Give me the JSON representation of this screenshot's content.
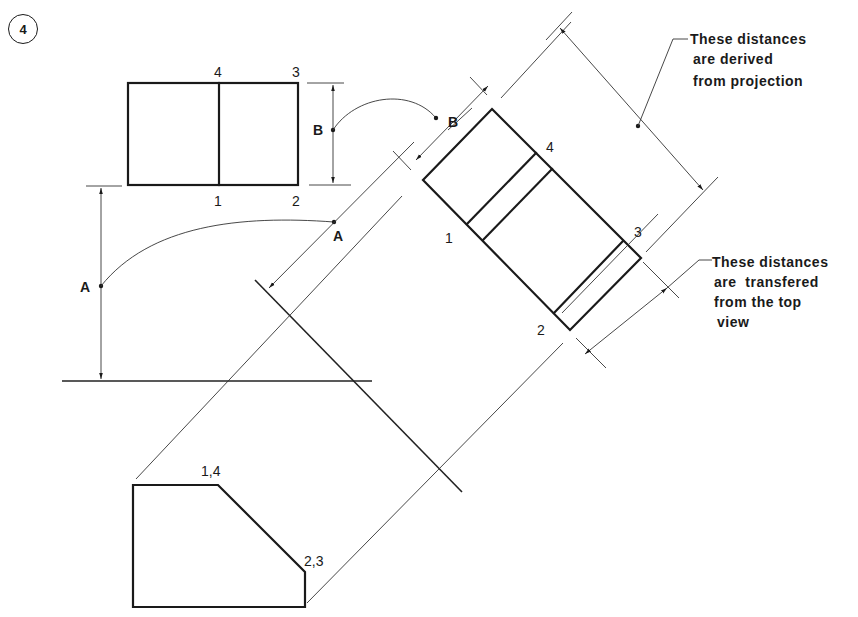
{
  "step_number": "4",
  "top_view": {
    "corner_labels": {
      "p4": "4",
      "p3": "3",
      "p1": "1",
      "p2": "2"
    },
    "dimension_label": "B"
  },
  "front_view": {
    "dimension_label": "A",
    "corner_labels": {
      "p14": "1,4",
      "p23": "2,3"
    }
  },
  "auxiliary_view": {
    "dimension_label_B": "B",
    "dimension_label_A": "A",
    "corner_labels": {
      "p1": "1",
      "p2": "2",
      "p3": "3",
      "p4": "4"
    }
  },
  "annotations": {
    "derived": [
      "These distances",
      "are derived",
      "from projection"
    ],
    "transferred": [
      "These distances",
      "are  transfered",
      "from the top",
      "view"
    ]
  },
  "colors": {
    "ink": "#1a1a1a",
    "background": "#ffffff"
  }
}
